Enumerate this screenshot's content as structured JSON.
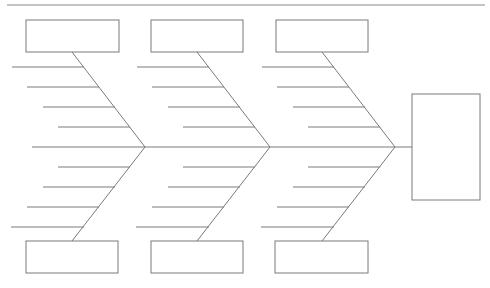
{
  "diagram": {
    "type": "fishbone",
    "line_color": "#7a7a7a",
    "background": "#ffffff",
    "effect": {
      "label": ""
    },
    "categories_top": [
      {
        "label": ""
      },
      {
        "label": ""
      },
      {
        "label": ""
      }
    ],
    "categories_bottom": [
      {
        "label": ""
      },
      {
        "label": ""
      },
      {
        "label": ""
      }
    ],
    "ribs_per_branch": 4
  }
}
